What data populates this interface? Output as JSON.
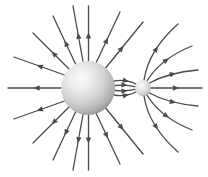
{
  "figure": {
    "width": 208,
    "height": 177,
    "background_color": "#ffffff",
    "line_color": "#4a4a4a",
    "line_width": 1.3
  },
  "chart_data": {
    "type": "diagram",
    "xlabel": "",
    "ylabel": "",
    "objects": [
      {
        "name": "large-sphere",
        "role": "source-charge",
        "cx": 88,
        "cy": 88,
        "r": 27,
        "fill_light": "#f2f2f2",
        "fill_mid": "#cdcdcd",
        "fill_dark": "#9a9a9a",
        "highlight_x": 36,
        "highlight_y": 32
      },
      {
        "name": "small-sphere",
        "role": "sink-charge",
        "cx": 143,
        "cy": 88,
        "r": 8,
        "fill_light": "#f4f4f4",
        "fill_mid": "#d2d2d2",
        "fill_dark": "#a0a0a0",
        "highlight_x": 38,
        "highlight_y": 34
      }
    ],
    "field_lines": [
      {
        "id": "radial-w",
        "d": "M 61 88 L 8 88",
        "arrows": [
          0.52
        ],
        "group": "radial-outward"
      },
      {
        "id": "radial-wnw",
        "d": "M 64.5 75 C 50 70 34 64 14 57",
        "arrows": [
          0.55
        ],
        "group": "radial-outward"
      },
      {
        "id": "radial-nw2",
        "d": "M 70 70 L 33 33",
        "arrows": [
          0.5
        ],
        "group": "radial-outward"
      },
      {
        "id": "radial-nw1",
        "d": "M 76 65 L 53 16",
        "arrows": [
          0.5
        ],
        "group": "radial-outward"
      },
      {
        "id": "radial-nnw",
        "d": "M 83 61.5 L 73 6",
        "arrows": [
          0.52
        ],
        "group": "radial-outward"
      },
      {
        "id": "radial-n",
        "d": "M 88.5 61 L 88.5 6",
        "arrows": [
          0.52
        ],
        "group": "radial-outward"
      },
      {
        "id": "radial-nne",
        "d": "M 96 63 L 120 12",
        "arrows": [
          0.5
        ],
        "group": "radial-outward"
      },
      {
        "id": "radial-ne",
        "d": "M 104 70 L 143 22",
        "arrows": [
          0.5
        ],
        "group": "radial-outward"
      },
      {
        "id": "radial-sse",
        "d": "M 96 113 L 120 164",
        "arrows": [
          0.5
        ],
        "group": "radial-outward"
      },
      {
        "id": "radial-se",
        "d": "M 104 106 L 143 154",
        "arrows": [
          0.5
        ],
        "group": "radial-outward"
      },
      {
        "id": "radial-s",
        "d": "M 88.5 115 L 88.5 170",
        "arrows": [
          0.52
        ],
        "group": "radial-outward"
      },
      {
        "id": "radial-ssw",
        "d": "M 83 114.5 L 73 170",
        "arrows": [
          0.52
        ],
        "group": "radial-outward"
      },
      {
        "id": "radial-sw1",
        "d": "M 76 111 L 53 160",
        "arrows": [
          0.5
        ],
        "group": "radial-outward"
      },
      {
        "id": "radial-sw2",
        "d": "M 70 106 L 33 143",
        "arrows": [
          0.5
        ],
        "group": "radial-outward"
      },
      {
        "id": "radial-wsw",
        "d": "M 64.5 101 C 50 106 34 112 14 119",
        "arrows": [
          0.55
        ],
        "group": "radial-outward"
      },
      {
        "id": "bridge-up2",
        "d": "M 114 81 C 124 79 133 82 137.5 85",
        "arrows": [
          0.62
        ],
        "group": "bridge"
      },
      {
        "id": "bridge-up1",
        "d": "M 115 85.5 C 124 84.5 131 85.5 136 86.8",
        "arrows": [
          0.6
        ],
        "group": "bridge"
      },
      {
        "id": "bridge-dn1",
        "d": "M 115 90.5 C 124 91.5 131 90.5 136 89.2",
        "arrows": [
          0.6
        ],
        "group": "bridge"
      },
      {
        "id": "bridge-dn2",
        "d": "M 114 95 C 124 97 133 94 137.5 91",
        "arrows": [
          0.62
        ],
        "group": "bridge"
      },
      {
        "id": "out-e",
        "d": "M 151 88 L 202 88",
        "arrows": [
          0.55
        ],
        "group": "small-outward"
      },
      {
        "id": "out-ene",
        "d": "M 149.5 83 C 162 76 176 72 198 70",
        "arrows": [
          0.56
        ],
        "group": "small-outward"
      },
      {
        "id": "out-ne",
        "d": "M 147 81 C 156 66 172 54 192 46",
        "arrows": [
          0.55
        ],
        "group": "small-outward"
      },
      {
        "id": "out-nne",
        "d": "M 144 80 C 147 60 160 40 178 24",
        "arrows": [
          0.55
        ],
        "group": "small-outward"
      },
      {
        "id": "out-ese",
        "d": "M 149.5 93 C 162 100 176 104 198 106",
        "arrows": [
          0.56
        ],
        "group": "small-outward"
      },
      {
        "id": "out-se",
        "d": "M 147 95 C 156 110 172 122 192 130",
        "arrows": [
          0.55
        ],
        "group": "small-outward"
      },
      {
        "id": "out-sse",
        "d": "M 144 96 C 147 116 160 136 178 152",
        "arrows": [
          0.55
        ],
        "group": "small-outward"
      }
    ],
    "legend": [],
    "annotations": []
  }
}
